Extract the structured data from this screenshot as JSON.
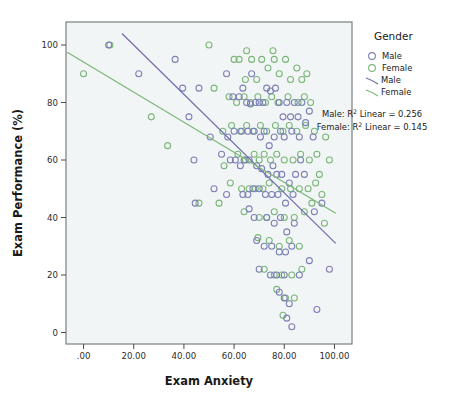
{
  "chart_data": {
    "type": "scatter",
    "title": "",
    "xlabel": "Exam Anxiety",
    "ylabel": "Exam Performance (%)",
    "xlim": [
      -7.0,
      107.0
    ],
    "ylim": [
      -4.0,
      108.0
    ],
    "xticks": [
      0,
      20,
      40,
      60,
      80,
      100
    ],
    "xtick_labels": [
      ".00",
      "20.00",
      "40.00",
      "60.00",
      "80.00",
      "100.00"
    ],
    "yticks": [
      0,
      20,
      40,
      60,
      80,
      100
    ],
    "ytick_labels": [
      "0",
      "20",
      "40",
      "60",
      "80",
      "100"
    ],
    "grid": false,
    "plot_bg": "#f2f5f6",
    "frame_color": "#6e7374",
    "legend": {
      "position": "right",
      "title": "Gender",
      "marker_entries": [
        {
          "label": "Male",
          "color": "#7b7fb5",
          "shape": "circle-open"
        },
        {
          "label": "Female",
          "color": "#79b577",
          "shape": "circle-open"
        }
      ],
      "line_entries": [
        {
          "label": "Male",
          "color": "#6d72ad"
        },
        {
          "label": "Female",
          "color": "#7fb87b"
        }
      ],
      "annotations": [
        {
          "prefix": "Male: R",
          "sup": "2",
          "suffix": " Linear = 0.256"
        },
        {
          "prefix": "Female: R",
          "sup": "2",
          "suffix": " Linear = 0.145"
        }
      ]
    },
    "fits": [
      {
        "name": "Male",
        "color": "#6d72ad",
        "x0": 15.3,
        "y0": 104.0,
        "x1": 100.5,
        "y1": 31.0,
        "slope": -0.857,
        "intercept": 117.1,
        "r2": 0.256
      },
      {
        "name": "Female",
        "color": "#7fb87b",
        "x0": -6.5,
        "y0": 97.5,
        "x1": 100.5,
        "y1": 41.5,
        "slope": -0.523,
        "intercept": 94.1,
        "r2": 0.145
      }
    ],
    "series": [
      {
        "name": "Male",
        "color": "#7b7fb5",
        "points": [
          [
            10.0,
            100.0
          ],
          [
            22.0,
            90.0
          ],
          [
            36.5,
            95.0
          ],
          [
            39.5,
            85.0
          ],
          [
            44.0,
            60.0
          ],
          [
            46.0,
            85.0
          ],
          [
            57.0,
            90.0
          ],
          [
            59.5,
            82.0
          ],
          [
            62.0,
            82.0
          ],
          [
            63.5,
            85.0
          ],
          [
            65.0,
            80.0
          ],
          [
            66.5,
            79.5
          ],
          [
            68.5,
            80.0
          ],
          [
            70.0,
            80.0
          ],
          [
            71.5,
            80.0
          ],
          [
            73.0,
            85.0
          ],
          [
            74.5,
            84.0
          ],
          [
            76.5,
            85.0
          ],
          [
            78.0,
            80.0
          ],
          [
            79.5,
            75.0
          ],
          [
            81.0,
            80.0
          ],
          [
            82.5,
            75.0
          ],
          [
            84.0,
            80.0
          ],
          [
            85.5,
            75.0
          ],
          [
            87.0,
            80.0
          ],
          [
            88.5,
            73.0
          ],
          [
            90.0,
            77.0
          ],
          [
            91.5,
            68.0
          ],
          [
            57.5,
            68.0
          ],
          [
            60.0,
            70.0
          ],
          [
            63.0,
            70.0
          ],
          [
            65.5,
            70.0
          ],
          [
            68.0,
            70.0
          ],
          [
            70.5,
            68.0
          ],
          [
            72.0,
            70.0
          ],
          [
            74.0,
            65.0
          ],
          [
            76.0,
            68.0
          ],
          [
            78.5,
            70.0
          ],
          [
            80.0,
            68.0
          ],
          [
            83.0,
            70.0
          ],
          [
            86.0,
            68.0
          ],
          [
            44.5,
            45.0
          ],
          [
            55.0,
            62.0
          ],
          [
            58.5,
            60.0
          ],
          [
            60.5,
            60.0
          ],
          [
            62.5,
            58.0
          ],
          [
            64.0,
            60.0
          ],
          [
            66.0,
            60.0
          ],
          [
            69.0,
            58.0
          ],
          [
            71.0,
            57.0
          ],
          [
            73.5,
            55.0
          ],
          [
            75.5,
            58.0
          ],
          [
            77.0,
            55.0
          ],
          [
            79.0,
            55.0
          ],
          [
            82.0,
            52.0
          ],
          [
            84.5,
            55.0
          ],
          [
            52.0,
            50.0
          ],
          [
            57.0,
            48.0
          ],
          [
            63.5,
            48.0
          ],
          [
            65.5,
            48.0
          ],
          [
            67.5,
            50.0
          ],
          [
            70.0,
            50.0
          ],
          [
            72.5,
            48.0
          ],
          [
            75.0,
            48.0
          ],
          [
            77.5,
            48.0
          ],
          [
            80.5,
            45.0
          ],
          [
            83.5,
            48.0
          ],
          [
            66.0,
            43.0
          ],
          [
            68.0,
            40.0
          ],
          [
            73.0,
            40.0
          ],
          [
            76.0,
            38.0
          ],
          [
            78.5,
            40.0
          ],
          [
            81.0,
            35.0
          ],
          [
            84.0,
            38.0
          ],
          [
            69.0,
            32.0
          ],
          [
            72.0,
            30.0
          ],
          [
            75.0,
            30.0
          ],
          [
            78.0,
            28.0
          ],
          [
            80.5,
            28.0
          ],
          [
            83.0,
            30.0
          ],
          [
            70.0,
            22.0
          ],
          [
            74.5,
            20.0
          ],
          [
            77.0,
            20.0
          ],
          [
            80.0,
            20.0
          ],
          [
            86.0,
            20.0
          ],
          [
            78.0,
            14.0
          ],
          [
            80.0,
            12.0
          ],
          [
            82.0,
            10.0
          ],
          [
            81.0,
            5.0
          ],
          [
            83.0,
            2.0
          ],
          [
            93.0,
            8.0
          ],
          [
            90.0,
            25.0
          ],
          [
            92.0,
            42.0
          ],
          [
            95.0,
            45.0
          ],
          [
            88.0,
            55.0
          ],
          [
            86.5,
            60.0
          ],
          [
            98.0,
            22.0
          ],
          [
            42.0,
            75.0
          ],
          [
            50.5,
            68.0
          ],
          [
            67.0,
            90.0
          ]
        ]
      },
      {
        "name": "Female",
        "color": "#79b577",
        "points": [
          [
            0.0,
            90.0
          ],
          [
            10.5,
            100.0
          ],
          [
            27.0,
            75.0
          ],
          [
            33.5,
            65.0
          ],
          [
            50.0,
            100.0
          ],
          [
            52.0,
            85.0
          ],
          [
            60.0,
            95.0
          ],
          [
            62.0,
            95.0
          ],
          [
            64.5,
            88.0
          ],
          [
            67.0,
            95.0
          ],
          [
            69.0,
            88.0
          ],
          [
            71.0,
            95.0
          ],
          [
            73.5,
            92.0
          ],
          [
            76.0,
            95.0
          ],
          [
            78.0,
            90.0
          ],
          [
            80.5,
            95.0
          ],
          [
            82.5,
            88.0
          ],
          [
            85.0,
            92.0
          ],
          [
            87.0,
            88.0
          ],
          [
            89.0,
            90.0
          ],
          [
            58.0,
            82.0
          ],
          [
            61.0,
            80.0
          ],
          [
            64.0,
            82.0
          ],
          [
            66.5,
            80.0
          ],
          [
            69.5,
            82.0
          ],
          [
            72.5,
            80.0
          ],
          [
            75.0,
            82.0
          ],
          [
            77.5,
            80.0
          ],
          [
            81.5,
            82.0
          ],
          [
            85.5,
            80.0
          ],
          [
            88.0,
            82.0
          ],
          [
            90.5,
            80.0
          ],
          [
            55.5,
            70.0
          ],
          [
            59.0,
            72.0
          ],
          [
            62.5,
            70.0
          ],
          [
            65.0,
            72.0
          ],
          [
            67.5,
            70.0
          ],
          [
            70.5,
            72.0
          ],
          [
            73.0,
            70.0
          ],
          [
            76.5,
            72.0
          ],
          [
            79.5,
            70.0
          ],
          [
            82.0,
            72.0
          ],
          [
            85.0,
            70.0
          ],
          [
            88.5,
            72.0
          ],
          [
            92.0,
            70.0
          ],
          [
            61.5,
            62.0
          ],
          [
            64.5,
            60.0
          ],
          [
            68.0,
            62.0
          ],
          [
            70.0,
            60.0
          ],
          [
            72.0,
            62.0
          ],
          [
            74.5,
            60.0
          ],
          [
            77.0,
            62.0
          ],
          [
            80.0,
            60.0
          ],
          [
            83.5,
            60.0
          ],
          [
            86.5,
            62.0
          ],
          [
            90.0,
            60.0
          ],
          [
            93.0,
            62.0
          ],
          [
            58.5,
            52.0
          ],
          [
            63.0,
            50.0
          ],
          [
            66.0,
            50.0
          ],
          [
            68.5,
            50.0
          ],
          [
            71.5,
            50.0
          ],
          [
            74.0,
            52.0
          ],
          [
            79.0,
            50.0
          ],
          [
            82.5,
            50.0
          ],
          [
            86.0,
            50.0
          ],
          [
            89.5,
            50.0
          ],
          [
            92.5,
            52.0
          ],
          [
            95.0,
            48.0
          ],
          [
            64.0,
            42.0
          ],
          [
            70.0,
            40.0
          ],
          [
            73.0,
            40.0
          ],
          [
            76.0,
            42.0
          ],
          [
            80.0,
            40.0
          ],
          [
            84.0,
            40.0
          ],
          [
            88.0,
            42.0
          ],
          [
            69.5,
            33.0
          ],
          [
            74.0,
            32.0
          ],
          [
            78.0,
            30.0
          ],
          [
            82.0,
            32.0
          ],
          [
            86.0,
            30.0
          ],
          [
            72.0,
            22.0
          ],
          [
            76.0,
            20.0
          ],
          [
            79.0,
            20.0
          ],
          [
            83.0,
            20.0
          ],
          [
            87.0,
            22.0
          ],
          [
            77.0,
            15.0
          ],
          [
            80.5,
            12.0
          ],
          [
            84.0,
            12.0
          ],
          [
            79.5,
            6.0
          ],
          [
            96.0,
            38.0
          ],
          [
            94.0,
            55.0
          ],
          [
            91.0,
            45.0
          ],
          [
            56.0,
            58.0
          ],
          [
            54.0,
            45.0
          ],
          [
            46.0,
            45.0
          ],
          [
            96.5,
            68.0
          ],
          [
            98.0,
            60.0
          ],
          [
            65.0,
            98.0
          ],
          [
            75.5,
            98.0
          ]
        ]
      }
    ]
  },
  "legend": {
    "title": "Gender",
    "male_marker_label": "Male",
    "female_marker_label": "Female",
    "male_line_label": "Male",
    "female_line_label": "Female",
    "male_r2_prefix": "Male: R",
    "male_r2_sup": "2",
    "male_r2_suffix": " Linear = 0.256",
    "female_r2_prefix": "Female: R",
    "female_r2_sup": "2",
    "female_r2_suffix": " Linear = 0.145"
  },
  "axes": {
    "x_title": "Exam Anxiety",
    "y_title": "Exam Performance (%)"
  }
}
